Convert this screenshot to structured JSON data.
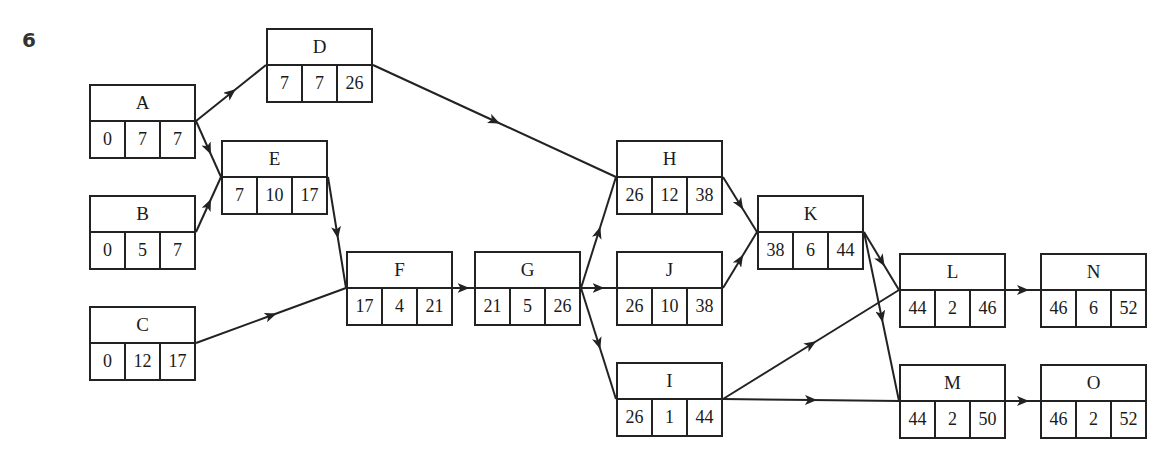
{
  "question_number": "6",
  "chart_data": {
    "type": "activity-on-node network",
    "nodes": [
      {
        "id": "A",
        "es": "0",
        "dur": "7",
        "ef": "7",
        "x": 89,
        "y": 84
      },
      {
        "id": "B",
        "es": "0",
        "dur": "5",
        "ef": "7",
        "x": 89,
        "y": 195
      },
      {
        "id": "C",
        "es": "0",
        "dur": "12",
        "ef": "17",
        "x": 89,
        "y": 306
      },
      {
        "id": "D",
        "es": "7",
        "dur": "7",
        "ef": "26",
        "x": 266,
        "y": 28
      },
      {
        "id": "E",
        "es": "7",
        "dur": "10",
        "ef": "17",
        "x": 221,
        "y": 140
      },
      {
        "id": "F",
        "es": "17",
        "dur": "4",
        "ef": "21",
        "x": 346,
        "y": 251
      },
      {
        "id": "G",
        "es": "21",
        "dur": "5",
        "ef": "26",
        "x": 474,
        "y": 251
      },
      {
        "id": "H",
        "es": "26",
        "dur": "12",
        "ef": "38",
        "x": 616,
        "y": 140
      },
      {
        "id": "J",
        "es": "26",
        "dur": "10",
        "ef": "38",
        "x": 616,
        "y": 251
      },
      {
        "id": "I",
        "es": "26",
        "dur": "1",
        "ef": "44",
        "x": 616,
        "y": 362
      },
      {
        "id": "K",
        "es": "38",
        "dur": "6",
        "ef": "44",
        "x": 757,
        "y": 195
      },
      {
        "id": "L",
        "es": "44",
        "dur": "2",
        "ef": "46",
        "x": 899,
        "y": 253
      },
      {
        "id": "M",
        "es": "44",
        "dur": "2",
        "ef": "50",
        "x": 899,
        "y": 364
      },
      {
        "id": "N",
        "es": "46",
        "dur": "6",
        "ef": "52",
        "x": 1040,
        "y": 253
      },
      {
        "id": "O",
        "es": "46",
        "dur": "2",
        "ef": "52",
        "x": 1040,
        "y": 364
      }
    ],
    "edges": [
      [
        "A",
        "D"
      ],
      [
        "A",
        "E"
      ],
      [
        "B",
        "E"
      ],
      [
        "E",
        "F"
      ],
      [
        "C",
        "F"
      ],
      [
        "D",
        "H"
      ],
      [
        "F",
        "G"
      ],
      [
        "G",
        "H"
      ],
      [
        "G",
        "J"
      ],
      [
        "G",
        "I"
      ],
      [
        "H",
        "K"
      ],
      [
        "J",
        "K"
      ],
      [
        "K",
        "L"
      ],
      [
        "K",
        "M"
      ],
      [
        "I",
        "L"
      ],
      [
        "I",
        "M"
      ],
      [
        "L",
        "N"
      ],
      [
        "M",
        "O"
      ]
    ]
  }
}
